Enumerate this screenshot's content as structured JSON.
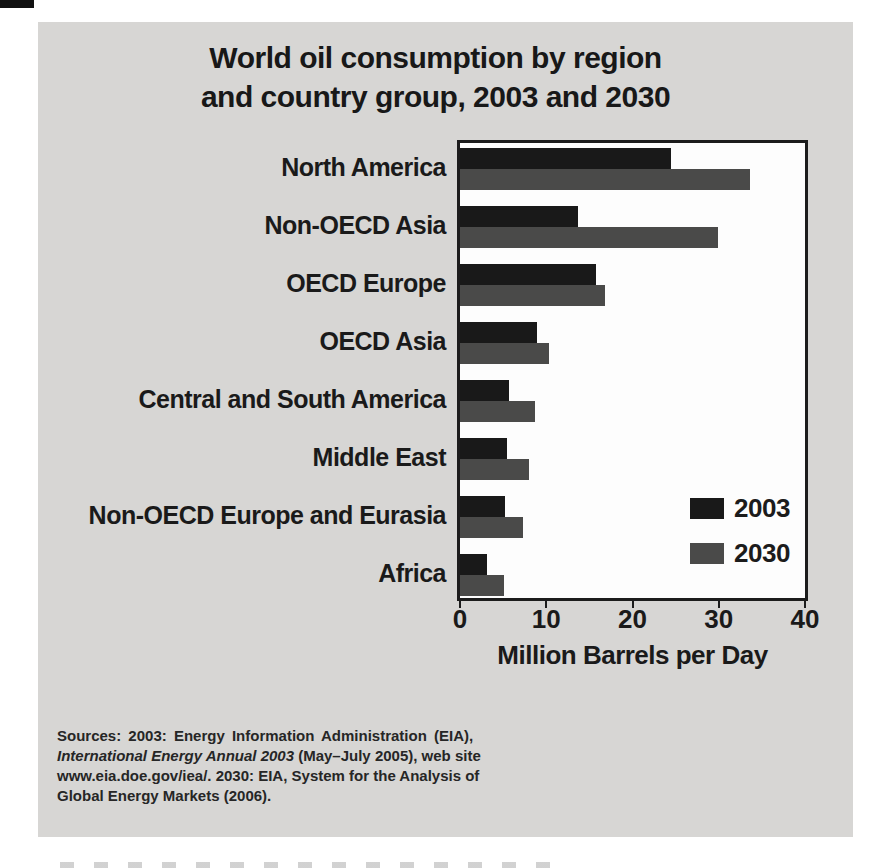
{
  "chart_data": {
    "type": "bar",
    "orientation": "horizontal",
    "title": "World oil consumption by region and country group, 2003 and 2030",
    "title_lines": [
      "World oil consumption by region",
      "and country group, 2003 and 2030"
    ],
    "categories": [
      "North America",
      "Non-OECD Asia",
      "OECD Europe",
      "OECD Asia",
      "Central and South America",
      "Middle East",
      "Non-OECD Europe and Eurasia",
      "Africa"
    ],
    "series": [
      {
        "name": "2003",
        "color": "#191919",
        "values": [
          24.5,
          13.7,
          15.8,
          8.9,
          5.7,
          5.4,
          5.2,
          3.1
        ]
      },
      {
        "name": "2030",
        "color": "#4a4a49",
        "values": [
          33.6,
          29.9,
          16.8,
          10.3,
          8.7,
          8.0,
          7.3,
          5.1
        ]
      }
    ],
    "xlabel": "Million Barrels per Day",
    "xlim": [
      0,
      40
    ],
    "xticks": [
      0,
      10,
      20,
      30,
      40
    ],
    "grid": false,
    "legend_position": "inside-right",
    "plot_background": "#fdfdfd",
    "panel_background": "#d7d6d4"
  },
  "sources": {
    "line1": "Sources: 2003: Energy Information Administration (EIA),",
    "line2_italic": "International Energy Annual 2003",
    "line2_rest": " (May–July 2005), web site",
    "line3": "www.eia.doe.gov/iea/. 2030: EIA, System for the Analysis of",
    "line4": "Global Energy Markets (2006)."
  }
}
